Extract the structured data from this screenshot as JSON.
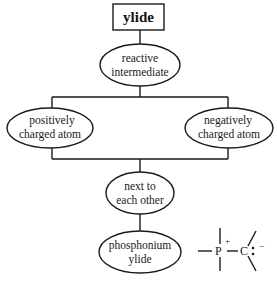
{
  "diagram": {
    "type": "concept-map",
    "root": {
      "label": "ylide",
      "shape": "rectangle"
    },
    "nodes": {
      "reactive": {
        "line1": "reactive",
        "line2": "intermediate",
        "shape": "ellipse"
      },
      "positive": {
        "line1": "positively",
        "line2": "charged atom",
        "shape": "ellipse"
      },
      "negative": {
        "line1": "negatively",
        "line2": "charged atom",
        "shape": "ellipse"
      },
      "adjacent": {
        "line1": "next to",
        "line2": "each other",
        "shape": "ellipse"
      },
      "phosphonium": {
        "line1": "phosphonium",
        "line2": "ylide",
        "shape": "ellipse"
      }
    },
    "edges": [
      [
        "ylide",
        "reactive intermediate"
      ],
      [
        "reactive intermediate",
        "positively charged atom"
      ],
      [
        "reactive intermediate",
        "negatively charged atom"
      ],
      [
        "positively charged atom",
        "next to each other"
      ],
      [
        "negatively charged atom",
        "next to each other"
      ],
      [
        "next to each other",
        "phosphonium ylide"
      ]
    ],
    "structure": {
      "phosphorus": "P",
      "phosphorus_charge": "+",
      "carbon": "C",
      "lone_pair": ":",
      "carbon_charge": "−"
    }
  }
}
